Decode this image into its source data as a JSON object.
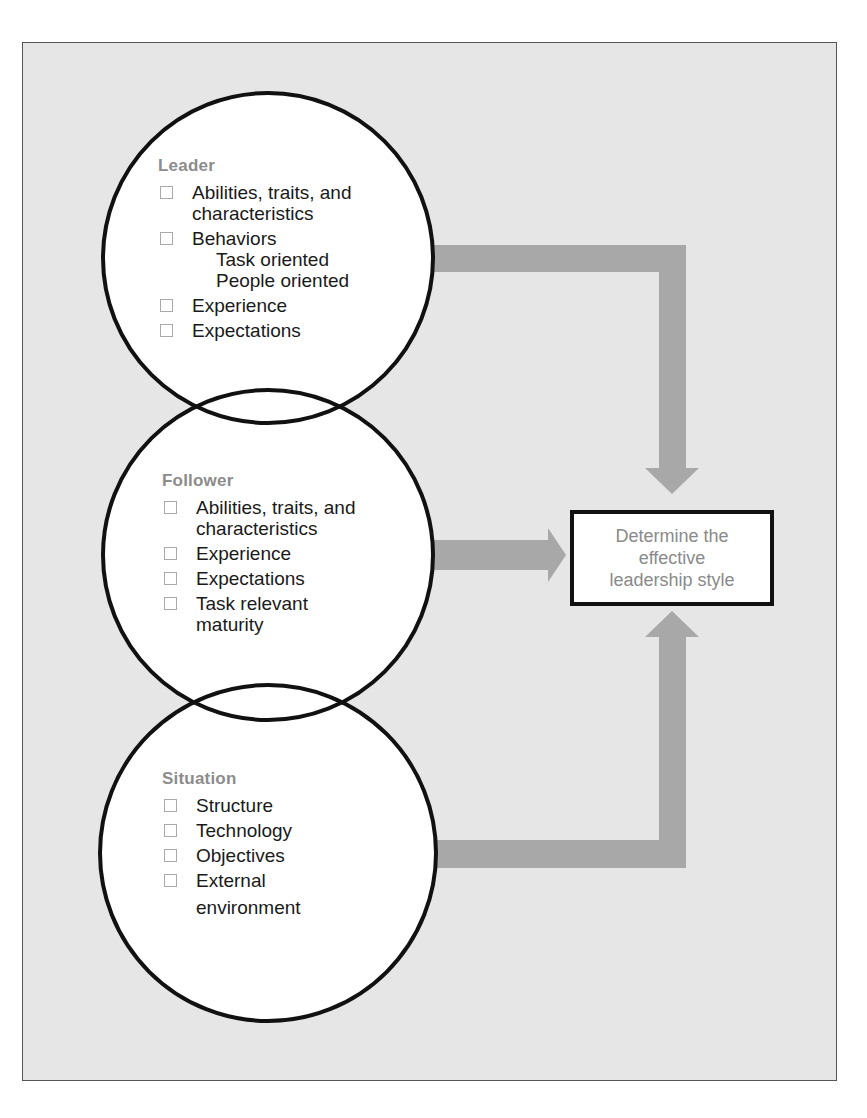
{
  "diagram": {
    "circles": [
      {
        "title": "Leader",
        "items": [
          {
            "text": "Abilities, traits, and characteristics",
            "lines": [
              "Abilities, traits, and",
              "characteristics"
            ]
          },
          {
            "text": "Behaviors",
            "lines": [
              "Behaviors"
            ],
            "sub": [
              "Task oriented",
              "People oriented"
            ]
          },
          {
            "text": "Experience",
            "lines": [
              "Experience"
            ]
          },
          {
            "text": "Expectations",
            "lines": [
              "Expectations"
            ]
          }
        ]
      },
      {
        "title": "Follower",
        "items": [
          {
            "text": "Abilities, traits, and characteristics",
            "lines": [
              "Abilities, traits, and",
              "characteristics"
            ]
          },
          {
            "text": "Experience",
            "lines": [
              "Experience"
            ]
          },
          {
            "text": "Expectations",
            "lines": [
              "Expectations"
            ]
          },
          {
            "text": "Task relevant maturity",
            "lines": [
              "Task relevant",
              "maturity"
            ]
          }
        ]
      },
      {
        "title": "Situation",
        "items": [
          {
            "text": "Structure",
            "lines": [
              "Structure"
            ]
          },
          {
            "text": "Technology",
            "lines": [
              "Technology"
            ]
          },
          {
            "text": "Objectives",
            "lines": [
              "Objectives"
            ]
          },
          {
            "text": "External environment",
            "lines": [
              "External",
              "environment"
            ]
          }
        ]
      }
    ],
    "result": {
      "lines": [
        "Determine the",
        "effective",
        "leadership style"
      ]
    },
    "colors": {
      "panel_bg": "#e6e6e6",
      "arrow": "#a8a8a8",
      "outline": "#111111",
      "title_text": "#8c8c8c",
      "result_text": "#8a8a8a"
    }
  }
}
